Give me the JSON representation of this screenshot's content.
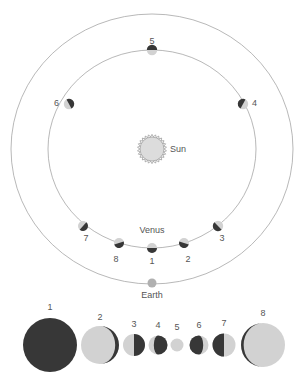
{
  "figure": {
    "title": "",
    "background_color": "#ffffff",
    "dark_color": "#373737",
    "light_color": "#d2d2d2",
    "orbit_stroke_color": "#9a9a9a",
    "label_color": "#555555"
  },
  "bodies": {
    "sun": {
      "label": "Sun",
      "icon": "sun-icon",
      "cx": 152,
      "cy": 149,
      "r": 12,
      "fill": "#dcdcdc",
      "spikes": 26
    },
    "earth": {
      "label": "Earth",
      "icon": "earth-icon",
      "cx": 152,
      "cy": 283,
      "r": 4.5,
      "fill": "#b0b0b0"
    },
    "venus": {
      "label": "Venus"
    }
  },
  "orbits": {
    "earth_orbit": {
      "name": "earth-orbit",
      "cx": 152,
      "cy": 149,
      "rx": 141,
      "ry": 135
    },
    "venus_orbit": {
      "name": "venus-orbit",
      "cx": 152,
      "cy": 149,
      "rx": 104,
      "ry": 99
    }
  },
  "orbit_positions": [
    {
      "id": "1",
      "label": "1",
      "cx": 152,
      "cy": 248,
      "r": 5.0,
      "dark_angle_deg": 0,
      "label_x": 152,
      "label_y": 264,
      "label_anchor": "middle"
    },
    {
      "id": "2",
      "label": "2",
      "cx": 184,
      "cy": 243,
      "r": 5.0,
      "dark_angle_deg": 18,
      "label_x": 188,
      "label_y": 262,
      "label_anchor": "middle"
    },
    {
      "id": "3",
      "label": "3",
      "cx": 218,
      "cy": 226,
      "r": 5.2,
      "dark_angle_deg": 46,
      "label_x": 222,
      "label_y": 241,
      "label_anchor": "middle"
    },
    {
      "id": "4",
      "label": "4",
      "cx": 243,
      "cy": 104,
      "r": 5.2,
      "dark_angle_deg": 118,
      "label_x": 252,
      "label_y": 106,
      "label_anchor": "start"
    },
    {
      "id": "5",
      "label": "5",
      "cx": 152,
      "cy": 50,
      "r": 5.2,
      "dark_angle_deg": 180,
      "label_x": 152,
      "label_y": 44,
      "label_anchor": "middle"
    },
    {
      "id": "6",
      "label": "6",
      "cx": 69,
      "cy": 104,
      "r": 5.2,
      "dark_angle_deg": 242,
      "label_x": 59,
      "label_y": 106,
      "label_anchor": "end"
    },
    {
      "id": "7",
      "label": "7",
      "cx": 83,
      "cy": 226,
      "r": 5.0,
      "dark_angle_deg": 312,
      "label_x": 86,
      "label_y": 241,
      "label_anchor": "middle"
    },
    {
      "id": "8",
      "label": "8",
      "cx": 119,
      "cy": 243,
      "r": 5.0,
      "dark_angle_deg": 342,
      "label_x": 116,
      "label_y": 262,
      "label_anchor": "middle"
    }
  ],
  "venus_label": {
    "text": "Venus",
    "x": 152,
    "y": 233
  },
  "earth_label": {
    "text": "Earth",
    "x": 152,
    "y": 298
  },
  "sun_label": {
    "text": "Sun",
    "x": 170,
    "y": 152
  },
  "phase_sequence": {
    "name": "venus-phase-sequence",
    "baseline_y": 345,
    "phases": [
      {
        "id": "1",
        "label": "1",
        "cx": 50,
        "r": 27.0,
        "illuminated_fraction": 0.0,
        "lit_side": "none",
        "label_y": 310
      },
      {
        "id": "2",
        "label": "2",
        "cx": 100,
        "r": 19.0,
        "illuminated_fraction": 0.1,
        "lit_side": "left",
        "label_y": 320
      },
      {
        "id": "3",
        "label": "3",
        "cx": 134,
        "r": 11.0,
        "illuminated_fraction": 0.5,
        "lit_side": "left",
        "label_y": 327
      },
      {
        "id": "4",
        "label": "4",
        "cx": 158,
        "r": 9.5,
        "illuminated_fraction": 0.72,
        "lit_side": "left",
        "label_y": 328
      },
      {
        "id": "5",
        "label": "5",
        "cx": 177,
        "r": 6.5,
        "illuminated_fraction": 1.0,
        "lit_side": "full",
        "label_y": 330
      },
      {
        "id": "6",
        "label": "6",
        "cx": 199,
        "r": 9.5,
        "illuminated_fraction": 0.72,
        "lit_side": "right",
        "label_y": 328
      },
      {
        "id": "7",
        "label": "7",
        "cx": 224,
        "r": 11.5,
        "illuminated_fraction": 0.5,
        "lit_side": "right",
        "label_y": 326
      },
      {
        "id": "8",
        "label": "8",
        "cx": 263,
        "r": 22.0,
        "illuminated_fraction": 0.06,
        "lit_side": "right",
        "label_y": 316
      }
    ]
  },
  "chart_data": {
    "type": "diagram",
    "series": [
      {
        "name": "Venus apparent phase and size",
        "categories": [
          "1",
          "2",
          "3",
          "4",
          "5",
          "6",
          "7",
          "8"
        ],
        "apparent_radius_px": [
          27.0,
          19.0,
          11.0,
          9.5,
          6.5,
          9.5,
          11.5,
          22.0
        ],
        "illuminated_fraction": [
          0.0,
          0.1,
          0.5,
          0.72,
          1.0,
          0.72,
          0.5,
          0.06
        ],
        "lit_side": [
          "none",
          "left",
          "left",
          "left",
          "full",
          "right",
          "right",
          "right"
        ]
      }
    ],
    "annotations": [
      "Sun",
      "Venus",
      "Earth"
    ],
    "legend": "none",
    "grid": false
  }
}
